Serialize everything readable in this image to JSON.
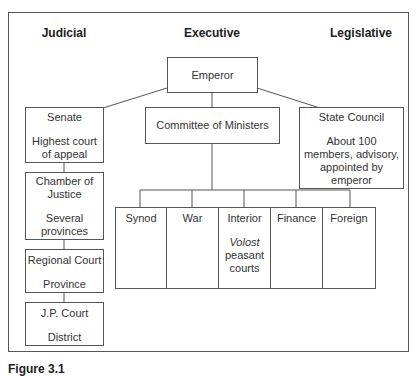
{
  "headings": {
    "judicial": "Judicial",
    "executive": "Executive",
    "legislative": "Legislative"
  },
  "executive": {
    "emperor": "Emperor",
    "committee": "Committee of Ministers",
    "ministries": [
      {
        "name": "Synod"
      },
      {
        "name": "War"
      },
      {
        "name": "Interior",
        "note_italic": "Volost",
        "note": "peasant courts"
      },
      {
        "name": "Finance"
      },
      {
        "name": "Foreign"
      }
    ]
  },
  "judicial": {
    "courts": [
      {
        "name": "Senate",
        "jurisdiction": "Highest court of appeal"
      },
      {
        "name": "Chamber of Justice",
        "jurisdiction": "Several provinces"
      },
      {
        "name": "Regional Court",
        "jurisdiction": "Province"
      },
      {
        "name": "J.P. Court",
        "jurisdiction": "District"
      }
    ]
  },
  "legislative": {
    "name": "State Council",
    "description": "About 100 members, advisory, appointed by emperor"
  },
  "caption": "Figure 3.1"
}
